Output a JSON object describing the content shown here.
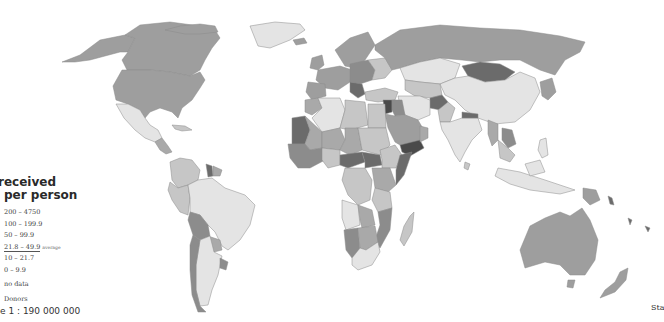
{
  "map": {
    "title_line1": "received",
    "title_line2": "per person",
    "colors": {
      "c200": "#4a4a4a",
      "c100": "#6b6b6b",
      "c50": "#8c8c8c",
      "c21": "#a9a9a9",
      "c10": "#c6c6c6",
      "c0": "#e4e4e4",
      "nodata": "#ffffff",
      "donors": "#9e9e9e",
      "border": "#8a8a8a"
    },
    "legend": [
      {
        "range": "200 – 4750"
      },
      {
        "range": "100 – 199.9"
      },
      {
        "range": "50 – 99.9"
      },
      {
        "range": "21.8 – 49.9",
        "note": "average"
      },
      {
        "range": "10 – 21.7"
      },
      {
        "range": "0 – 9.9"
      },
      {
        "range": "no data"
      },
      {
        "range": "Donors"
      }
    ],
    "scale": "e 1 : 190 000 000",
    "source_fragment": "Sta"
  }
}
